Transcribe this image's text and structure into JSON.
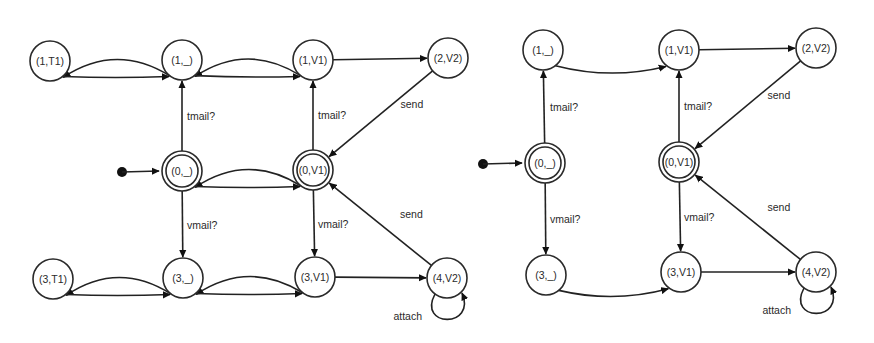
{
  "diagrams": [
    {
      "name": "left-automaton",
      "nodes": [
        {
          "id": "1T1",
          "label": "(1,T1)",
          "x": 50,
          "y": 61,
          "accepting": false
        },
        {
          "id": "1_",
          "label": "(1,_)",
          "x": 182,
          "y": 60,
          "accepting": false
        },
        {
          "id": "1V1",
          "label": "(1,V1)",
          "x": 313,
          "y": 60,
          "accepting": false
        },
        {
          "id": "2V2",
          "label": "(2,V2)",
          "x": 448,
          "y": 58,
          "accepting": false
        },
        {
          "id": "0_",
          "label": "(0,_)",
          "x": 182,
          "y": 171,
          "accepting": true
        },
        {
          "id": "0V1",
          "label": "(0,V1)",
          "x": 313,
          "y": 170,
          "accepting": true
        },
        {
          "id": "3T1",
          "label": "(3,T1)",
          "x": 53,
          "y": 279,
          "accepting": false
        },
        {
          "id": "3_",
          "label": "(3,_)",
          "x": 183,
          "y": 278,
          "accepting": false
        },
        {
          "id": "3V1",
          "label": "(3,V1)",
          "x": 315,
          "y": 277,
          "accepting": false
        },
        {
          "id": "4V2",
          "label": "(4,V2)",
          "x": 447,
          "y": 278,
          "accepting": false
        }
      ],
      "initial": {
        "from_x": 122,
        "from_y": 172,
        "to": "0_"
      },
      "edges": [
        {
          "from": "1_",
          "to": "1T1",
          "bend": -1,
          "label": ""
        },
        {
          "from": "1T1",
          "to": "1_",
          "bend": -1,
          "label": ""
        },
        {
          "from": "1V1",
          "to": "1_",
          "bend": -1,
          "label": ""
        },
        {
          "from": "1_",
          "to": "1V1",
          "bend": -1,
          "label": ""
        },
        {
          "from": "1V1",
          "to": "2V2",
          "bend": 0,
          "label": ""
        },
        {
          "from": "2V2",
          "to": "0V1",
          "bend": 0,
          "label": "send"
        },
        {
          "from": "0_",
          "to": "1_",
          "bend": 0,
          "label": "tmail?"
        },
        {
          "from": "0V1",
          "to": "1V1",
          "bend": 0,
          "label": "tmail?"
        },
        {
          "from": "0V1",
          "to": "0_",
          "bend": -1,
          "label": ""
        },
        {
          "from": "0_",
          "to": "0V1",
          "bend": -1,
          "label": ""
        },
        {
          "from": "0_",
          "to": "3_",
          "bend": 0,
          "label": "vmail?"
        },
        {
          "from": "0V1",
          "to": "3V1",
          "bend": 0,
          "label": "vmail?"
        },
        {
          "from": "3_",
          "to": "3T1",
          "bend": -1,
          "label": ""
        },
        {
          "from": "3T1",
          "to": "3_",
          "bend": -1,
          "label": ""
        },
        {
          "from": "3V1",
          "to": "3_",
          "bend": -1,
          "label": ""
        },
        {
          "from": "3_",
          "to": "3V1",
          "bend": -1,
          "label": ""
        },
        {
          "from": "3V1",
          "to": "4V2",
          "bend": 0,
          "label": ""
        },
        {
          "from": "4V2",
          "to": "0V1",
          "bend": 0,
          "label": "send"
        },
        {
          "from": "4V2",
          "to": "4V2",
          "loop": true,
          "label": "attach"
        }
      ]
    },
    {
      "name": "right-automaton",
      "nodes": [
        {
          "id": "1_",
          "label": "(1,_)",
          "x": 543,
          "y": 50,
          "accepting": false
        },
        {
          "id": "1V1",
          "label": "(1,V1)",
          "x": 679,
          "y": 50,
          "accepting": false
        },
        {
          "id": "2V2",
          "label": "(2,V2)",
          "x": 816,
          "y": 48,
          "accepting": false
        },
        {
          "id": "0_",
          "label": "(0,_)",
          "x": 545,
          "y": 163,
          "accepting": true
        },
        {
          "id": "0V1",
          "label": "(0,V1)",
          "x": 679,
          "y": 162,
          "accepting": true
        },
        {
          "id": "3_",
          "label": "(3,_)",
          "x": 546,
          "y": 275,
          "accepting": false
        },
        {
          "id": "3V1",
          "label": "(3,V1)",
          "x": 681,
          "y": 272,
          "accepting": false
        },
        {
          "id": "4V2",
          "label": "(4,V2)",
          "x": 816,
          "y": 272,
          "accepting": false
        }
      ],
      "initial": {
        "from_x": 483,
        "from_y": 164,
        "to": "0_"
      },
      "edges": [
        {
          "from": "0_",
          "to": "1_",
          "bend": 0,
          "label": "tmail?"
        },
        {
          "from": "1_",
          "to": "1V1",
          "bend": 1,
          "label": ""
        },
        {
          "from": "1V1",
          "to": "2V2",
          "bend": 0,
          "label": ""
        },
        {
          "from": "2V2",
          "to": "0V1",
          "bend": 0,
          "label": "send"
        },
        {
          "from": "0V1",
          "to": "1V1",
          "bend": 0,
          "label": "tmail?"
        },
        {
          "from": "0_",
          "to": "3_",
          "bend": 0,
          "label": "vmail?"
        },
        {
          "from": "0V1",
          "to": "3V1",
          "bend": 0,
          "label": "vmail?"
        },
        {
          "from": "3_",
          "to": "3V1",
          "bend": 1,
          "label": ""
        },
        {
          "from": "3V1",
          "to": "4V2",
          "bend": 0,
          "label": ""
        },
        {
          "from": "4V2",
          "to": "0V1",
          "bend": 0,
          "label": "send"
        },
        {
          "from": "4V2",
          "to": "4V2",
          "loop": true,
          "label": "attach"
        }
      ]
    }
  ]
}
